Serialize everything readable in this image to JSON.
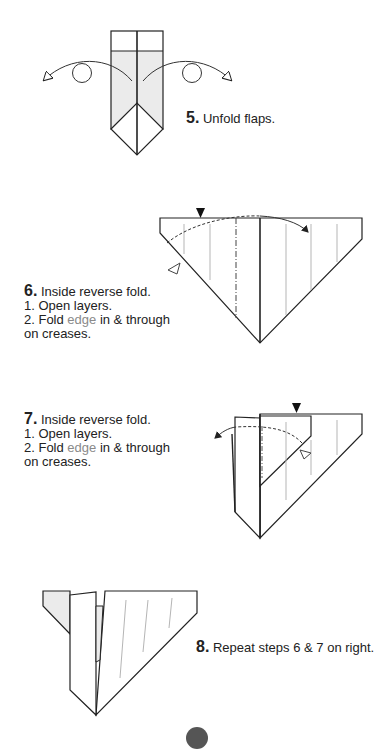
{
  "steps": [
    {
      "number": "5.",
      "title": "Unfold flaps."
    },
    {
      "number": "6.",
      "title": "Inside reverse fold.",
      "line1": "1. Open layers.",
      "line2_pre": "2. Fold ",
      "line2_highlight": "edge",
      "line2_post": " in & through",
      "line3": "on creases."
    },
    {
      "number": "7.",
      "title": "Inside reverse fold.",
      "line1": "1. Open layers.",
      "line2_pre": "2. Fold ",
      "line2_highlight": "edge",
      "line2_post": " in & through",
      "line3": "on creases."
    },
    {
      "number": "8.",
      "title": "Repeat steps 6 & 7 on right."
    }
  ],
  "colors": {
    "line": "#222222",
    "shade": "#ebebeb",
    "crease": "#b5b5b5",
    "highlight_text": "#8a8a8a"
  }
}
